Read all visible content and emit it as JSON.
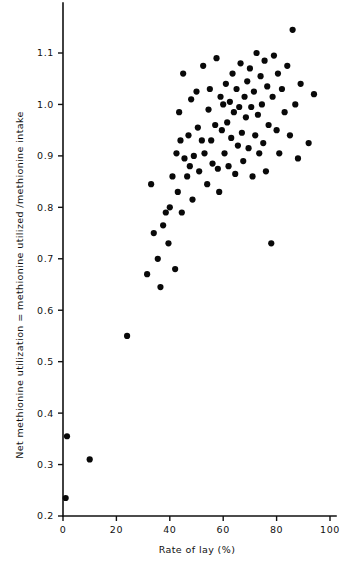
{
  "figure": {
    "background_color": "#ffffff",
    "ink_color": "#111111",
    "marker_color": "#090909",
    "marker_shape": "filled-circle",
    "marker_radius_px": 3.1
  },
  "chart_data": {
    "type": "scatter",
    "title": "",
    "subtitle": "",
    "xlabel": "Rate of lay (%)",
    "ylabel": "Net methionine utilization = methionine utilized /methionine intake",
    "xlim": [
      0,
      100
    ],
    "ylim": [
      0.2,
      1.1
    ],
    "xticks": [
      0,
      20,
      40,
      60,
      80,
      100
    ],
    "xticklabels": [
      "0",
      "20",
      "40",
      "60",
      "80",
      "100"
    ],
    "yticks": [
      0.2,
      0.3,
      0.4,
      0.5,
      0.6,
      0.7,
      0.8,
      0.9,
      1.0,
      1.1
    ],
    "yticklabels": [
      "0.2",
      "0.3",
      "0.4",
      "0.5",
      "0.6",
      "0.7",
      "0.8",
      "0.9",
      "1.0",
      "1.1"
    ],
    "grid": false,
    "legend": null,
    "legend_position": "none",
    "annotations": [],
    "tick_direction": "out",
    "spines": [
      "left",
      "bottom"
    ],
    "n_points": 96,
    "series": [
      {
        "name": "observations",
        "marker": "filled-circle",
        "color": "#090909",
        "points": [
          [
            1.0,
            0.235
          ],
          [
            1.5,
            0.355
          ],
          [
            10.0,
            0.31
          ],
          [
            24.0,
            0.55
          ],
          [
            31.5,
            0.67
          ],
          [
            33.0,
            0.845
          ],
          [
            34.0,
            0.75
          ],
          [
            35.5,
            0.7
          ],
          [
            36.5,
            0.645
          ],
          [
            37.5,
            0.765
          ],
          [
            38.5,
            0.79
          ],
          [
            39.5,
            0.73
          ],
          [
            40.0,
            0.8
          ],
          [
            41.0,
            0.86
          ],
          [
            42.0,
            0.68
          ],
          [
            42.5,
            0.905
          ],
          [
            43.0,
            0.83
          ],
          [
            43.5,
            0.985
          ],
          [
            44.0,
            0.93
          ],
          [
            44.5,
            0.79
          ],
          [
            45.0,
            1.06
          ],
          [
            45.5,
            0.895
          ],
          [
            46.5,
            0.86
          ],
          [
            47.0,
            0.94
          ],
          [
            47.5,
            0.88
          ],
          [
            48.0,
            1.01
          ],
          [
            48.5,
            0.815
          ],
          [
            49.0,
            0.9
          ],
          [
            50.0,
            1.025
          ],
          [
            50.5,
            0.955
          ],
          [
            51.0,
            0.87
          ],
          [
            52.0,
            0.93
          ],
          [
            52.5,
            1.075
          ],
          [
            53.0,
            0.905
          ],
          [
            54.0,
            0.845
          ],
          [
            54.5,
            0.99
          ],
          [
            55.0,
            1.03
          ],
          [
            55.5,
            0.93
          ],
          [
            56.0,
            0.885
          ],
          [
            57.0,
            0.96
          ],
          [
            57.5,
            1.09
          ],
          [
            58.0,
            0.875
          ],
          [
            58.5,
            0.83
          ],
          [
            59.0,
            1.015
          ],
          [
            59.5,
            0.95
          ],
          [
            60.0,
            1.0
          ],
          [
            60.5,
            0.905
          ],
          [
            61.0,
            1.04
          ],
          [
            61.5,
            0.965
          ],
          [
            62.0,
            0.88
          ],
          [
            62.5,
            1.005
          ],
          [
            63.0,
            0.935
          ],
          [
            63.5,
            1.06
          ],
          [
            64.0,
            0.985
          ],
          [
            64.5,
            0.865
          ],
          [
            65.0,
            1.03
          ],
          [
            65.5,
            0.92
          ],
          [
            66.0,
            0.995
          ],
          [
            66.5,
            1.08
          ],
          [
            67.0,
            0.945
          ],
          [
            67.5,
            0.89
          ],
          [
            68.0,
            1.015
          ],
          [
            68.5,
            0.975
          ],
          [
            69.0,
            1.045
          ],
          [
            69.5,
            0.915
          ],
          [
            70.0,
            1.07
          ],
          [
            70.5,
            0.995
          ],
          [
            71.0,
            0.86
          ],
          [
            71.5,
            1.025
          ],
          [
            72.0,
            0.94
          ],
          [
            72.5,
            1.1
          ],
          [
            73.0,
            0.98
          ],
          [
            73.5,
            0.905
          ],
          [
            74.0,
            1.055
          ],
          [
            74.5,
            1.0
          ],
          [
            75.0,
            0.925
          ],
          [
            75.5,
            1.085
          ],
          [
            76.0,
            0.87
          ],
          [
            76.5,
            1.035
          ],
          [
            77.0,
            0.96
          ],
          [
            78.0,
            0.73
          ],
          [
            78.5,
            1.015
          ],
          [
            79.0,
            1.095
          ],
          [
            80.0,
            0.95
          ],
          [
            80.5,
            1.06
          ],
          [
            81.0,
            0.905
          ],
          [
            82.0,
            1.03
          ],
          [
            83.0,
            0.985
          ],
          [
            84.0,
            1.075
          ],
          [
            85.0,
            0.94
          ],
          [
            86.0,
            1.145
          ],
          [
            87.0,
            1.0
          ],
          [
            88.0,
            0.895
          ],
          [
            89.0,
            1.04
          ],
          [
            92.0,
            0.925
          ],
          [
            94.0,
            1.02
          ]
        ]
      }
    ]
  }
}
